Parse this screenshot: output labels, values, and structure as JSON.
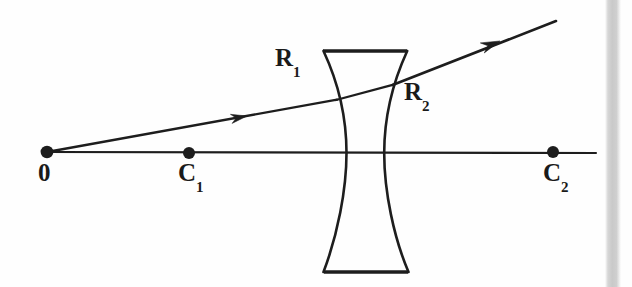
{
  "figure": {
    "kind": "optics-ray-diagram",
    "background_color": "#fefefe",
    "ink_color": "#1a1a1a",
    "width": 632,
    "height": 287
  },
  "labels": {
    "origin": {
      "text": "0",
      "sub": ""
    },
    "center_one": {
      "text": "C",
      "sub": "1"
    },
    "center_two": {
      "text": "C",
      "sub": "2"
    },
    "radius_one": {
      "text": "R",
      "sub": "1"
    },
    "radius_two": {
      "text": "R",
      "sub": "2"
    }
  },
  "points": [
    {
      "name": "origin",
      "label": "0",
      "sub": "",
      "x": 47,
      "y": 152,
      "r": 6.0
    },
    {
      "name": "center-one",
      "label": "C",
      "sub": "1",
      "x": 189,
      "y": 153,
      "r": 5.8
    },
    {
      "name": "center-two",
      "label": "C",
      "sub": "2",
      "x": 553,
      "y": 152,
      "r": 5.8
    }
  ],
  "optical_axis": {
    "x1": 45,
    "y1": 152,
    "x2": 596,
    "y2": 153
  },
  "lens": {
    "type": "biconcave",
    "top_edge": {
      "x1": 323,
      "y1": 51,
      "x2": 407,
      "y2": 51
    },
    "bottom_edge": {
      "x1": 324,
      "y1": 272,
      "x2": 408,
      "y2": 272
    },
    "left_surface": {
      "top_x": 324,
      "waist_x": 346,
      "bottom_x": 324
    },
    "right_surface": {
      "top_x": 407,
      "waist_x": 384,
      "bottom_x": 408
    },
    "waist_y": 153
  },
  "rays": {
    "incident": {
      "from": {
        "x": 47,
        "y": 152
      },
      "to": {
        "x": 336,
        "y": 100
      },
      "arrow_at": {
        "x": 247,
        "y": 116
      }
    },
    "internal": {
      "from": {
        "x": 336,
        "y": 100
      },
      "to": {
        "x": 393,
        "y": 85
      }
    },
    "exit": {
      "from": {
        "x": 393,
        "y": 85
      },
      "to": {
        "x": 556,
        "y": 21
      },
      "arrow_at": {
        "x": 498,
        "y": 42
      }
    }
  },
  "scan_edge_bar": {
    "x": 605,
    "width": 16,
    "color": "#cdcdcd"
  }
}
